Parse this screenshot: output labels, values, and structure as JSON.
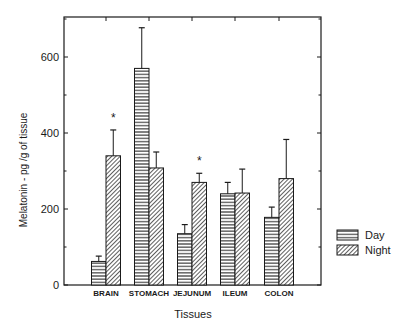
{
  "chart_data": {
    "type": "bar",
    "title": "",
    "xlabel": "Tissues",
    "ylabel": "Melatonin - pg /g of tissue",
    "ylim": [
      0,
      700
    ],
    "yticks": [
      0,
      200,
      400,
      600
    ],
    "grid": false,
    "legend_position": "right",
    "categories": [
      "BRAIN",
      "STOMACH",
      "JEJUNUM",
      "ILEUM",
      "COLON"
    ],
    "series": [
      {
        "name": "Day",
        "pattern": "horizontal-lines",
        "values": [
          62,
          570,
          135,
          240,
          178
        ],
        "error": [
          14,
          107,
          24,
          30,
          27
        ]
      },
      {
        "name": "Night",
        "pattern": "diagonal-hatch",
        "values": [
          340,
          308,
          270,
          242,
          280
        ],
        "error": [
          68,
          42,
          24,
          63,
          103
        ]
      }
    ],
    "annotations": [
      {
        "category": "BRAIN",
        "text": "*"
      },
      {
        "category": "JEJUNUM",
        "text": "*"
      }
    ]
  },
  "legend": {
    "items": [
      {
        "label": "Day"
      },
      {
        "label": "Night"
      }
    ]
  }
}
